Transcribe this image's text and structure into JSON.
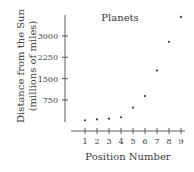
{
  "chart_data": {
    "type": "scatter",
    "title": "Planets",
    "xlabel": "Position Number",
    "ylabel": "Distance from the Sun",
    "ylabel_sub": "(millions of miles)",
    "x": [
      1,
      2,
      3,
      4,
      5,
      6,
      7,
      8,
      9
    ],
    "values": [
      36,
      67,
      93,
      142,
      484,
      887,
      1784,
      2795,
      3670
    ],
    "xticks": [
      "1",
      "2",
      "3",
      "4",
      "5",
      "6",
      "7",
      "8",
      "9"
    ],
    "yticks": [
      750,
      1500,
      2250,
      3000
    ],
    "ytick_labels": [
      "750",
      "1500",
      "2250",
      "3000"
    ],
    "xlim": [
      0,
      9.2
    ],
    "ylim": [
      0,
      3700
    ],
    "grid": false,
    "legend": "none"
  }
}
